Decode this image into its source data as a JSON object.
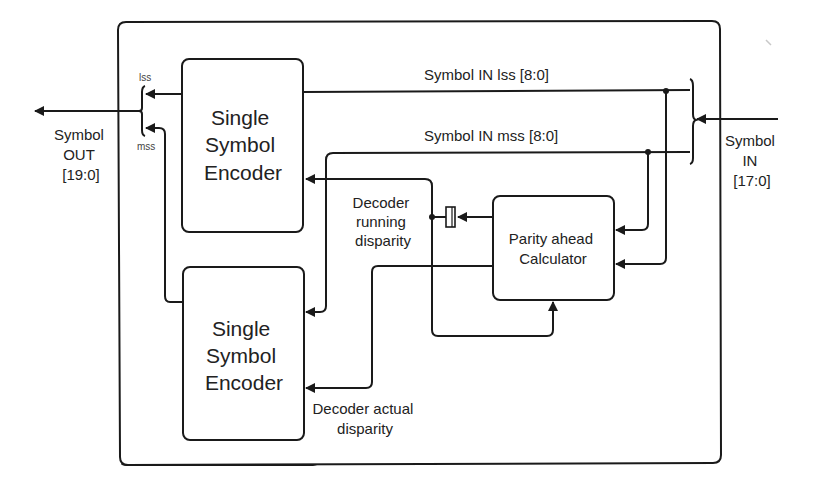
{
  "diagram": {
    "type": "block-diagram",
    "outer_block": {
      "label": ""
    },
    "blocks": {
      "encoder_top": {
        "lines": [
          "Single",
          "Symbol",
          "Encoder"
        ]
      },
      "encoder_bottom": {
        "lines": [
          "Single",
          "Symbol",
          "Encoder"
        ]
      },
      "parity": {
        "lines": [
          "Parity ahead",
          "Calculator"
        ]
      }
    },
    "signals": {
      "symbol_in_lss": "Symbol IN lss [8:0]",
      "symbol_in_mss": "Symbol IN mss [8:0]",
      "running_disparity": [
        "Decoder",
        "running",
        "disparity"
      ],
      "actual_disparity": [
        "Decoder actual",
        "disparity"
      ]
    },
    "ports": {
      "input": [
        "Symbol",
        "IN",
        "[17:0]"
      ],
      "output": [
        "Symbol",
        "OUT",
        "[19:0]"
      ],
      "out_lss": "lss",
      "out_mss": "mss"
    },
    "colors": {
      "line": "#1a1a1a",
      "text": "#222222",
      "background": "#ffffff"
    }
  }
}
